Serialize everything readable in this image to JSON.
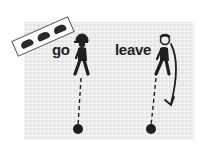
{
  "figure": {
    "panel_color": "#e6e6e6",
    "ink_color": "#1f1f1f",
    "sign": {
      "icon": "cars-sign-icon",
      "car_count": 3
    },
    "panels": [
      {
        "label": "go",
        "figure": "walking-person-cap-icon",
        "marker": "dot"
      },
      {
        "label": "leave",
        "figure": "walking-person-looking-back-icon",
        "marker": "dot",
        "arrow": "curved-arrow-down"
      }
    ]
  }
}
